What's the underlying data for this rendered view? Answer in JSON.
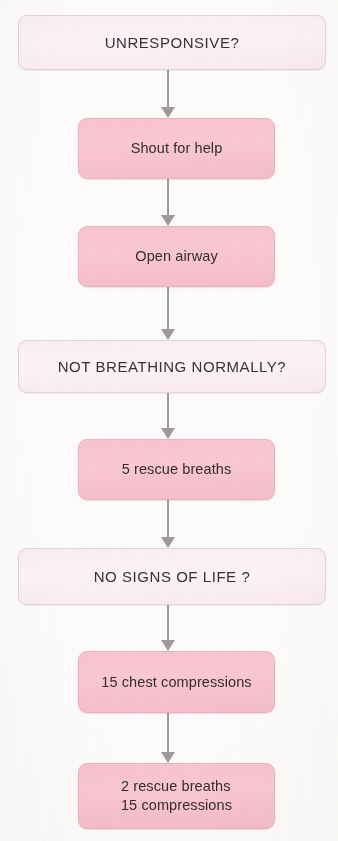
{
  "diagram": {
    "background_color": "#fdfcfa",
    "question_box_color": "#fbeef2",
    "action_box_color": "#f8c3ce",
    "arrow_color": "#9e9a9b",
    "text_color": "#332b2c"
  },
  "nodes": [
    {
      "id": "unresponsive",
      "label": "UNRESPONSIVE?",
      "kind": "question",
      "x": 18,
      "y": 15,
      "w": 308,
      "h": 55
    },
    {
      "id": "shout-for-help",
      "label": "Shout for help",
      "kind": "action",
      "x": 78,
      "y": 118,
      "w": 197,
      "h": 61
    },
    {
      "id": "open-airway",
      "label": "Open airway",
      "kind": "action",
      "x": 78,
      "y": 226,
      "w": 197,
      "h": 61
    },
    {
      "id": "not-breathing-normally",
      "label": "NOT BREATHING NORMALLY?",
      "kind": "question",
      "x": 18,
      "y": 340,
      "w": 308,
      "h": 53
    },
    {
      "id": "five-rescue-breaths",
      "label": "5 rescue breaths",
      "kind": "action",
      "x": 78,
      "y": 439,
      "w": 197,
      "h": 61
    },
    {
      "id": "no-signs-of-life",
      "label": "NO SIGNS OF LIFE ?",
      "kind": "question",
      "x": 18,
      "y": 548,
      "w": 308,
      "h": 57
    },
    {
      "id": "fifteen-chest-compressions",
      "label": "15 chest compressions",
      "kind": "action",
      "x": 78,
      "y": 651,
      "w": 197,
      "h": 62
    },
    {
      "id": "two-breaths-fifteen-compressions",
      "label": "2 rescue breaths\n15 compressions",
      "kind": "action",
      "align": "left",
      "x": 78,
      "y": 763,
      "w": 197,
      "h": 66
    }
  ],
  "connectors": [
    {
      "id": "arrow-unresponsive-to-shout",
      "from": "unresponsive",
      "to": "shout-for-help",
      "x": 168,
      "y": 70,
      "h": 48
    },
    {
      "id": "arrow-shout-to-open-airway",
      "from": "shout-for-help",
      "to": "open-airway",
      "x": 168,
      "y": 179,
      "h": 47
    },
    {
      "id": "arrow-open-airway-to-not-breathing",
      "from": "open-airway",
      "to": "not-breathing-normally",
      "x": 168,
      "y": 287,
      "h": 53
    },
    {
      "id": "arrow-not-breathing-to-five-breaths",
      "from": "not-breathing-normally",
      "to": "five-rescue-breaths",
      "x": 168,
      "y": 393,
      "h": 46
    },
    {
      "id": "arrow-five-breaths-to-no-signs",
      "from": "five-rescue-breaths",
      "to": "no-signs-of-life",
      "x": 168,
      "y": 500,
      "h": 48
    },
    {
      "id": "arrow-no-signs-to-compressions",
      "from": "no-signs-of-life",
      "to": "fifteen-chest-compressions",
      "x": 168,
      "y": 605,
      "h": 46
    },
    {
      "id": "arrow-compressions-to-breaths-cycle",
      "from": "fifteen-chest-compressions",
      "to": "two-breaths-fifteen-compressions",
      "x": 168,
      "y": 713,
      "h": 50
    }
  ]
}
